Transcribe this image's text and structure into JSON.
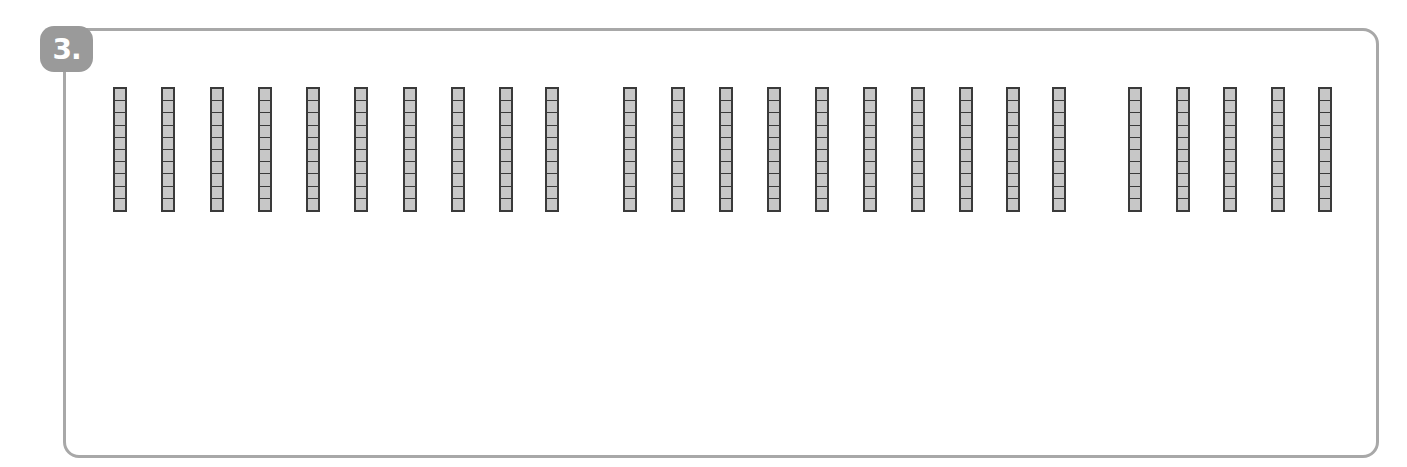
{
  "problem": {
    "number_label": "3.",
    "badge_color": "#9a9a9a",
    "border_color": "#a8a8a8"
  },
  "base_ten_blocks": {
    "rod_fill_color": "#c7c7c7",
    "rod_outline_color": "#3a3a3a",
    "cells_per_rod": 10,
    "groups": [
      {
        "rods": 10,
        "x_positions": [
          113,
          161,
          210,
          258,
          306,
          354,
          403,
          451,
          499,
          545
        ]
      },
      {
        "rods": 10,
        "x_positions": [
          623,
          671,
          719,
          767,
          815,
          863,
          911,
          959,
          1006,
          1052
        ]
      },
      {
        "rods": 5,
        "x_positions": [
          1128,
          1176,
          1223,
          1271,
          1318
        ]
      }
    ],
    "total_rods": 25,
    "total_value": 250
  }
}
